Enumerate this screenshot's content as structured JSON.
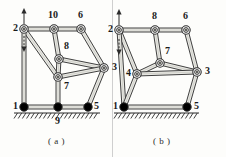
{
  "figure": {
    "caption_a": "( a )",
    "caption_b": "( b )",
    "panels": [
      {
        "id": "a",
        "caption": "( a )",
        "nodes": [
          {
            "label": "2",
            "x": 24,
            "y": 29,
            "type": "pivot",
            "label_dx": -11,
            "label_dy": -7
          },
          {
            "label": "10",
            "x": 54,
            "y": 29,
            "type": "pivot",
            "label_dx": -6,
            "label_dy": -20
          },
          {
            "label": "6",
            "x": 81,
            "y": 29,
            "type": "pivot",
            "label_dx": -3,
            "label_dy": -20
          },
          {
            "label": "8",
            "x": 59,
            "y": 59,
            "type": "pivot",
            "label_dx": 5,
            "label_dy": -19
          },
          {
            "label": "7",
            "x": 58,
            "y": 77,
            "type": "pivot",
            "label_dx": 6,
            "label_dy": 3
          },
          {
            "label": "3",
            "x": 104,
            "y": 68,
            "type": "pivot",
            "label_dx": 8,
            "label_dy": -7
          },
          {
            "label": "1",
            "x": 24,
            "y": 107,
            "type": "ground",
            "label_dx": -11,
            "label_dy": -7
          },
          {
            "label": "9",
            "x": 58,
            "y": 107,
            "type": "ground",
            "label_dx": -3,
            "label_dy": 8
          },
          {
            "label": "5",
            "x": 88,
            "y": 107,
            "type": "ground",
            "label_dx": 6,
            "label_dy": -7
          }
        ],
        "links": [
          [
            "2",
            "10"
          ],
          [
            "10",
            "6"
          ],
          [
            "2",
            "7"
          ],
          [
            "2",
            "1"
          ],
          [
            "10",
            "8"
          ],
          [
            "6",
            "3"
          ],
          [
            "8",
            "7"
          ],
          [
            "8",
            "3"
          ],
          [
            "7",
            "3"
          ],
          [
            "7",
            "9"
          ],
          [
            "1",
            "9"
          ],
          [
            "9",
            "5"
          ],
          [
            "5",
            "3"
          ]
        ],
        "ground_span": {
          "x1": 14,
          "x2": 100,
          "y": 113
        },
        "arrow": {
          "x": 24,
          "y_top": 8,
          "y_bottom": 52,
          "style": "double-vertical"
        }
      },
      {
        "id": "b",
        "caption": "( b )",
        "nodes": [
          {
            "label": "2",
            "x": 119,
            "y": 30,
            "type": "pivot",
            "label_dx": -11,
            "label_dy": -7
          },
          {
            "label": "8",
            "x": 155,
            "y": 30,
            "type": "pivot",
            "label_dx": -3,
            "label_dy": -20
          },
          {
            "label": "6",
            "x": 186,
            "y": 30,
            "type": "pivot",
            "label_dx": -3,
            "label_dy": -20
          },
          {
            "label": "7",
            "x": 160,
            "y": 63,
            "type": "pivot",
            "label_dx": 5,
            "label_dy": -18
          },
          {
            "label": "4",
            "x": 137,
            "y": 74,
            "type": "pivot",
            "label_dx": -11,
            "label_dy": -7
          },
          {
            "label": "3",
            "x": 197,
            "y": 72,
            "type": "pivot",
            "label_dx": 8,
            "label_dy": -7
          },
          {
            "label": "1",
            "x": 124,
            "y": 107,
            "type": "ground",
            "label_dx": -11,
            "label_dy": -7
          },
          {
            "label": "5",
            "x": 187,
            "y": 107,
            "type": "ground",
            "label_dx": 7,
            "label_dy": -7
          }
        ],
        "links": [
          [
            "2",
            "8"
          ],
          [
            "8",
            "6"
          ],
          [
            "2",
            "4"
          ],
          [
            "2",
            "1"
          ],
          [
            "8",
            "7"
          ],
          [
            "6",
            "3"
          ],
          [
            "7",
            "4"
          ],
          [
            "7",
            "3"
          ],
          [
            "4",
            "3"
          ],
          [
            "4",
            "1"
          ],
          [
            "1",
            "5"
          ],
          [
            "5",
            "3"
          ]
        ],
        "ground_span": {
          "x1": 114,
          "x2": 199,
          "y": 113
        },
        "arrow": {
          "x": 119,
          "y_top": 9,
          "y_bottom": 55,
          "style": "double-vertical"
        }
      }
    ]
  },
  "style": {
    "link_fill": "#e9e9e4",
    "link_stroke": "#2b2b2b",
    "pivot_fill": "#ffffff",
    "ground_fill": "#000000",
    "hatch_color": "#2b2b2b",
    "label_color": "#1a1a1a",
    "background": "#fdfdfb"
  }
}
